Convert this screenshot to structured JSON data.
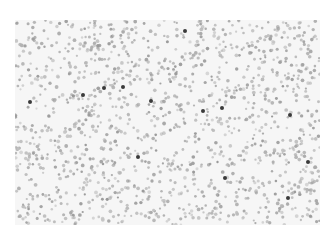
{
  "image": {
    "description": "Microscopy field of a blood smear: densely scattered grey cells on a light background with a few darker stained cells",
    "background": "#ffffff",
    "field_color": "#f6f6f6",
    "cell_color": "#a8a8a8",
    "dark_cell_color": "#3a3a3a",
    "dark_cells": [
      [
        30,
        102
      ],
      [
        83,
        95
      ],
      [
        104,
        88
      ],
      [
        123,
        87
      ],
      [
        151,
        101
      ],
      [
        185,
        31
      ],
      [
        203,
        111
      ],
      [
        222,
        108
      ],
      [
        290,
        115
      ],
      [
        138,
        157
      ],
      [
        225,
        178
      ],
      [
        308,
        162
      ],
      [
        288,
        198
      ]
    ]
  }
}
